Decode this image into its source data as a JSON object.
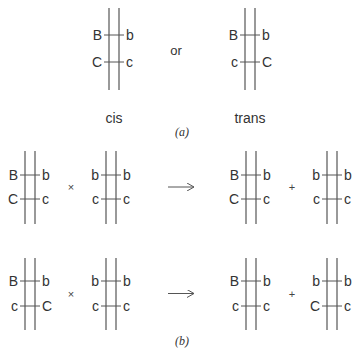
{
  "panel_a": {
    "label": "(a)",
    "connector": "or",
    "diagrams": [
      {
        "caption": "cis",
        "left": [
          "B",
          "C"
        ],
        "right": [
          "b",
          "c"
        ]
      },
      {
        "caption": "trans",
        "left": [
          "B",
          "c"
        ],
        "right": [
          "b",
          "C"
        ]
      }
    ]
  },
  "panel_b": {
    "label": "(b)",
    "cross_symbol": "×",
    "plus_symbol": "+",
    "rows": [
      {
        "parent1": {
          "left": [
            "B",
            "C"
          ],
          "right": [
            "b",
            "c"
          ]
        },
        "parent2": {
          "left": [
            "b",
            "c"
          ],
          "right": [
            "b",
            "c"
          ]
        },
        "offspring1": {
          "left": [
            "B",
            "C"
          ],
          "right": [
            "b",
            "c"
          ]
        },
        "offspring2": {
          "left": [
            "b",
            "c"
          ],
          "right": [
            "b",
            "c"
          ]
        }
      },
      {
        "parent1": {
          "left": [
            "B",
            "c"
          ],
          "right": [
            "b",
            "C"
          ]
        },
        "parent2": {
          "left": [
            "b",
            "c"
          ],
          "right": [
            "b",
            "c"
          ]
        },
        "offspring1": {
          "left": [
            "B",
            "c"
          ],
          "right": [
            "b",
            "c"
          ]
        },
        "offspring2": {
          "left": [
            "b",
            "C"
          ],
          "right": [
            "b",
            "c"
          ]
        }
      }
    ]
  }
}
